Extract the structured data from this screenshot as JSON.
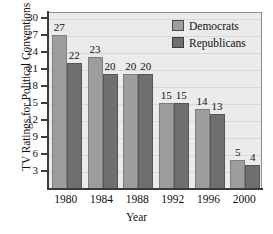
{
  "chart_data": {
    "type": "bar",
    "title": "",
    "xlabel": "Year",
    "ylabel": "TV Ratings for Political Conventions",
    "categories": [
      "1980",
      "1984",
      "1988",
      "1992",
      "1996",
      "2000"
    ],
    "series": [
      {
        "name": "Democrats",
        "values": [
          27,
          23,
          20,
          15,
          14,
          5
        ],
        "color": "#9d9d9d"
      },
      {
        "name": "Republicans",
        "values": [
          22,
          20,
          20,
          15,
          13,
          4
        ],
        "color": "#6f6f6f"
      }
    ],
    "ylim": [
      0,
      31
    ],
    "yticks": [
      3,
      6,
      9,
      12,
      15,
      18,
      21,
      24,
      27,
      30
    ],
    "grid": true,
    "legend_position": "top-right",
    "plot_background": "#ebebeb"
  },
  "axes": {
    "y_title": "TV Ratings for Political Conventions",
    "x_title": "Year",
    "y_tick_labels": [
      "30",
      "27",
      "24",
      "21",
      "18",
      "15",
      "12",
      "9",
      "6",
      "3"
    ],
    "x_tick_labels": [
      "1980",
      "1984",
      "1988",
      "1992",
      "1996",
      "2000"
    ]
  },
  "legend": {
    "items": [
      {
        "label": "Democrats"
      },
      {
        "label": "Republicans"
      }
    ]
  },
  "bar_labels": {
    "g0": {
      "dem": "27",
      "rep": "22"
    },
    "g1": {
      "dem": "23",
      "rep": "20"
    },
    "g2": {
      "dem": "20",
      "rep": "20"
    },
    "g3": {
      "dem": "15",
      "rep": "15"
    },
    "g4": {
      "dem": "14",
      "rep": "13"
    },
    "g5": {
      "dem": "5",
      "rep": "4"
    }
  }
}
